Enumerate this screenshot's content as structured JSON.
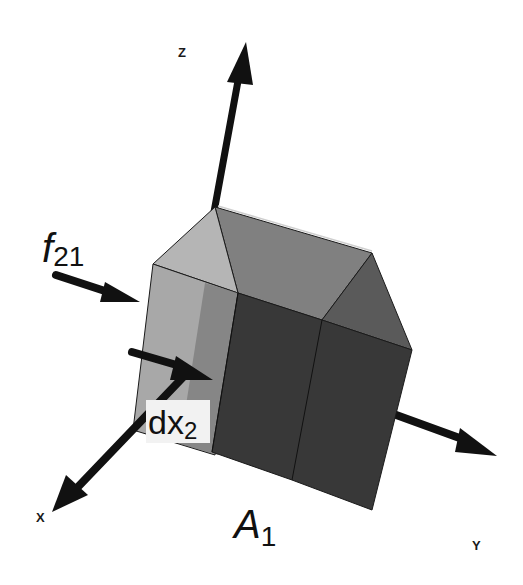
{
  "diagram": {
    "axes": [
      {
        "id": "z",
        "label": "Z"
      },
      {
        "id": "x",
        "label": "X"
      },
      {
        "id": "y",
        "label": "Y"
      }
    ],
    "force": {
      "symbol": "f",
      "subscript": "21"
    },
    "length": {
      "symbol": "dx",
      "subscript": "2"
    },
    "area": {
      "symbol": "A",
      "subscript": "1"
    },
    "colors": {
      "background": "#ffffff",
      "arrow": "#111111",
      "front_face": "#3a3a3a",
      "side_face_light": "#a9a9a9",
      "roof_face": "#7c7c7c",
      "roof_side": "#5c5c5c",
      "edge": "#1a1a1a",
      "label_box": "#f2f2f2"
    }
  }
}
